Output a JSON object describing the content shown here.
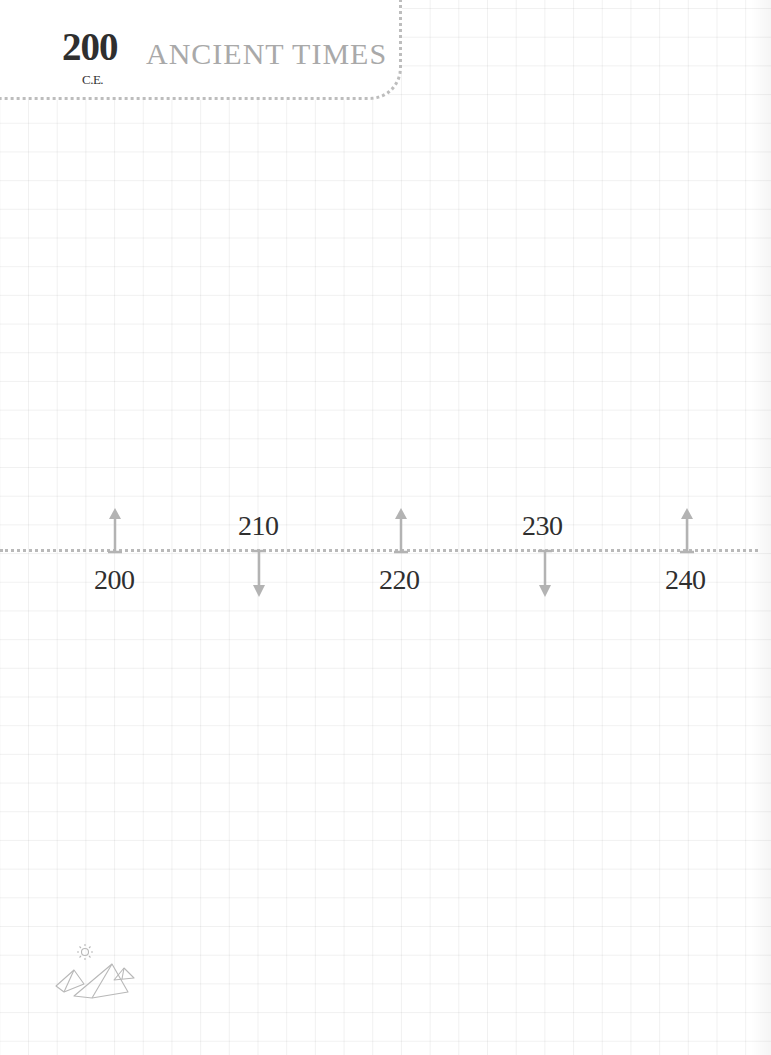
{
  "header": {
    "year": "200",
    "era": "C.E.",
    "title": "ANCIENT TIMES"
  },
  "timeline": {
    "ticks": [
      {
        "label": "200",
        "direction": "up",
        "position": "below"
      },
      {
        "label": "210",
        "direction": "down",
        "position": "above"
      },
      {
        "label": "220",
        "direction": "up",
        "position": "below"
      },
      {
        "label": "230",
        "direction": "down",
        "position": "above"
      },
      {
        "label": "240",
        "direction": "up",
        "position": "below"
      }
    ]
  },
  "footer": {
    "icon": "pyramids-icon"
  },
  "colors": {
    "year_text": "#2f2f2f",
    "title_text": "#a9a9a9",
    "arrow": "#b3b3b3",
    "dotted_line": "#b9b9b9",
    "grid": "#eeeeee"
  }
}
